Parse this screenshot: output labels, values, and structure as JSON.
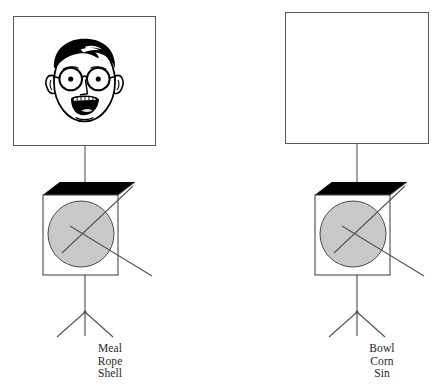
{
  "page": {
    "background_color": "#ffffff",
    "width": 440,
    "height": 388
  },
  "palette": {
    "background": "#ffffff",
    "frame_border": "#5a5a5a",
    "line": "#555555",
    "cube_shadow": "#000000",
    "cube_front": "#ffffff",
    "circle_fill": "#c9c9c9",
    "circle_stroke": "#4a4a4a",
    "text": "#1f1f1f",
    "art_ink": "#000000"
  },
  "units": [
    {
      "id": "left",
      "frame": {
        "label": "picture-frame",
        "content": "face-illustration",
        "content_description": "Cartoon line drawing of a man's head with dark hair, round eyeglasses, ears and an open smiling mouth showing teeth",
        "empty": false
      },
      "cube": {
        "label": "shaded-cube-with-circle",
        "circle_label": "gray-circle",
        "radiating_lines": 2
      },
      "stand": {
        "label": "tripod-stand",
        "legs": 2
      },
      "caption": {
        "lines": [
          "Meal",
          "Rope",
          "Shell"
        ],
        "line1": "Meal",
        "line2": "Rope",
        "line3": "Shell"
      }
    },
    {
      "id": "right",
      "frame": {
        "label": "picture-frame",
        "content": "empty",
        "content_description": "Blank white rectangle with no illustration",
        "empty": true
      },
      "cube": {
        "label": "shaded-cube-with-circle",
        "circle_label": "gray-circle",
        "radiating_lines": 2
      },
      "stand": {
        "label": "tripod-stand",
        "legs": 2
      },
      "caption": {
        "lines": [
          "Bowl",
          "Corn",
          "Sin"
        ],
        "line1": "Bowl",
        "line2": "Corn",
        "line3": "Sin"
      }
    }
  ]
}
